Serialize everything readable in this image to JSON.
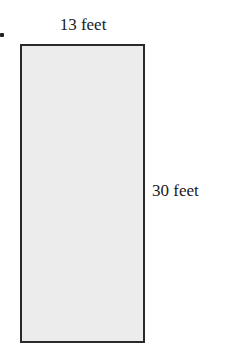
{
  "figure": {
    "shape": "rectangle",
    "fill_color": "#ececec",
    "stroke_color": "#2a2a2a",
    "width_label": "13 feet",
    "height_label": "30 feet"
  }
}
